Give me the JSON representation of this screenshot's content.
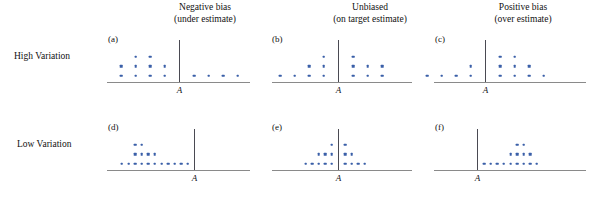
{
  "figure": {
    "title": "",
    "background": "#ffffff",
    "dot_color": "#3a5fa8",
    "baseline_color": "#8a8a8a",
    "vline_color": "#4a4a52"
  },
  "columns": [
    {
      "line1": "Negative bias",
      "line2": "(under estimate)"
    },
    {
      "line1": "Unbiased",
      "line2": "(on target estimate)"
    },
    {
      "line1": "Positive bias",
      "line2": "(over estimate)"
    }
  ],
  "rows": [
    {
      "label": "High Variation"
    },
    {
      "label": "Low Variation"
    }
  ],
  "axis_label": "A",
  "panels": [
    {
      "tag": "(a)",
      "row": 0,
      "col": 0
    },
    {
      "tag": "(b)",
      "row": 0,
      "col": 1
    },
    {
      "tag": "(c)",
      "row": 0,
      "col": 2
    },
    {
      "tag": "(d)",
      "row": 1,
      "col": 0
    },
    {
      "tag": "(e)",
      "row": 1,
      "col": 1
    },
    {
      "tag": "(f)",
      "row": 1,
      "col": 2
    }
  ],
  "chart_data": {
    "type": "scatter",
    "xlabel": "A",
    "ylabel": "",
    "grid": false,
    "legend": null,
    "note": "Each panel is a stacked dot plot (one dot = one observation). x is measured in dot-slot units relative to the target line A at x = 0. Stack level 1 = bottom row.",
    "panels": [
      {
        "tag": "(a)",
        "row_label": "High Variation",
        "column_label": "Negative bias (under estimate)",
        "target_x": 0,
        "total_dots": 14,
        "stacks": [
          {
            "level": 1,
            "count": 8,
            "x": [
              -4,
              -3,
              -2,
              -1,
              1,
              2,
              3,
              4
            ]
          },
          {
            "level": 2,
            "count": 4,
            "x": [
              -4,
              -3,
              -2,
              -1
            ]
          },
          {
            "level": 3,
            "count": 2,
            "x": [
              -3,
              -2
            ]
          }
        ]
      },
      {
        "tag": "(b)",
        "row_label": "High Variation",
        "column_label": "Unbiased (on target estimate)",
        "target_x": 0,
        "total_dots": 14,
        "stacks": [
          {
            "level": 1,
            "count": 7,
            "x": [
              -4,
              -3,
              -2,
              -1,
              1,
              2,
              3
            ]
          },
          {
            "level": 2,
            "count": 5,
            "x": [
              -2,
              -1,
              1,
              2,
              3
            ]
          },
          {
            "level": 3,
            "count": 2,
            "x": [
              -1,
              1
            ]
          }
        ]
      },
      {
        "tag": "(c)",
        "row_label": "High Variation",
        "column_label": "Positive bias (over estimate)",
        "target_x": 0,
        "total_dots": 14,
        "stacks": [
          {
            "level": 1,
            "count": 8,
            "x": [
              -4,
              -3,
              -2,
              -1,
              1,
              2,
              3,
              4
            ]
          },
          {
            "level": 2,
            "count": 4,
            "x": [
              -1,
              1,
              2,
              3
            ]
          },
          {
            "level": 3,
            "count": 2,
            "x": [
              1,
              2
            ]
          }
        ]
      },
      {
        "tag": "(d)",
        "row_label": "Low Variation",
        "column_label": "Negative bias (under estimate)",
        "target_x": 0,
        "total_dots": 17,
        "stacks": [
          {
            "level": 1,
            "count": 11,
            "x": [
              -11,
              -10,
              -9,
              -8,
              -7,
              -6,
              -5,
              -4,
              -3,
              -2,
              -1
            ]
          },
          {
            "level": 2,
            "count": 4,
            "x": [
              -9,
              -8,
              -7,
              -6
            ]
          },
          {
            "level": 3,
            "count": 2,
            "x": [
              -9,
              -8
            ]
          }
        ]
      },
      {
        "tag": "(e)",
        "row_label": "Low Variation",
        "column_label": "Unbiased (on target estimate)",
        "target_x": 0,
        "total_dots": 16,
        "stacks": [
          {
            "level": 1,
            "count": 9,
            "x": [
              -5,
              -4,
              -3,
              -2,
              -1,
              1,
              2,
              3,
              4
            ]
          },
          {
            "level": 2,
            "count": 5,
            "x": [
              -3,
              -2,
              -1,
              1,
              2
            ]
          },
          {
            "level": 3,
            "count": 2,
            "x": [
              -1,
              1
            ]
          }
        ]
      },
      {
        "tag": "(f)",
        "row_label": "Low Variation",
        "column_label": "Positive bias (over estimate)",
        "target_x": 0,
        "total_dots": 15,
        "stacks": [
          {
            "level": 1,
            "count": 9,
            "x": [
              1,
              2,
              3,
              4,
              5,
              6,
              7,
              8,
              9
            ]
          },
          {
            "level": 2,
            "count": 4,
            "x": [
              5,
              6,
              7,
              8
            ]
          },
          {
            "level": 3,
            "count": 2,
            "x": [
              6,
              7
            ]
          }
        ]
      }
    ]
  }
}
